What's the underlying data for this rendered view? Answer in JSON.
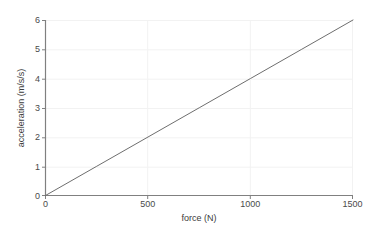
{
  "chart_data": {
    "type": "line",
    "title": "",
    "xlabel": "force (N)",
    "ylabel": "acceleration (m/s/s)",
    "xlim": [
      0,
      1500
    ],
    "ylim": [
      0,
      6
    ],
    "xticks": [
      0,
      500,
      1000,
      1500
    ],
    "yticks": [
      0,
      1,
      2,
      3,
      4,
      5,
      6
    ],
    "xtick_labels": [
      "0",
      "500",
      "1000",
      "1500"
    ],
    "ytick_labels": [
      "0",
      "1",
      "2",
      "3",
      "4",
      "5",
      "6"
    ],
    "grid": true,
    "grid_axis": "both",
    "legend": false,
    "legend_position": "none",
    "series": [
      {
        "name": "acceleration vs force",
        "x": [
          0,
          250,
          500,
          750,
          1000,
          1250,
          1500
        ],
        "y": [
          0,
          1,
          2,
          3,
          4,
          5,
          6
        ],
        "color": "#6e6e6e",
        "linewidth": 1.0
      }
    ]
  },
  "style": {
    "background": "#ffffff",
    "grid_color": "#f2f2f2",
    "axis_color": "#808080",
    "tick_text_color": "#4a4a4a",
    "label_text_color": "#3c3c3c",
    "line_color": "#6e6e6e"
  }
}
